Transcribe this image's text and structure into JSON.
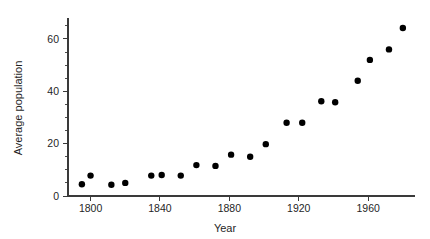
{
  "chart_data": {
    "type": "scatter",
    "title": "",
    "subtitle": "",
    "xlabel": "Year",
    "ylabel": "Average population",
    "xlim": [
      1787,
      1987
    ],
    "ylim": [
      0,
      68
    ],
    "xticks": [
      1800,
      1840,
      1880,
      1920,
      1960
    ],
    "xtick_labels": [
      "1800",
      "1840",
      "1880",
      "1920",
      "1960"
    ],
    "yticks": [
      0,
      20,
      40,
      60
    ],
    "ytick_labels": [
      "0",
      "20",
      "40",
      "60"
    ],
    "y_minor_ticks": [
      5,
      10,
      15,
      25,
      30,
      35,
      45,
      50,
      55,
      65
    ],
    "grid": false,
    "legend": null,
    "marker": "filled-circle",
    "marker_color": "#000000",
    "marker_size_px": 3.2,
    "points": [
      {
        "x": 1795,
        "y": 4.5
      },
      {
        "x": 1800,
        "y": 7.8
      },
      {
        "x": 1812,
        "y": 4.3
      },
      {
        "x": 1820,
        "y": 5.0
      },
      {
        "x": 1835,
        "y": 7.8
      },
      {
        "x": 1841,
        "y": 8.0
      },
      {
        "x": 1852,
        "y": 7.8
      },
      {
        "x": 1861,
        "y": 11.8
      },
      {
        "x": 1872,
        "y": 11.5
      },
      {
        "x": 1881,
        "y": 15.8
      },
      {
        "x": 1892,
        "y": 15.0
      },
      {
        "x": 1901,
        "y": 19.8
      },
      {
        "x": 1913,
        "y": 28.0
      },
      {
        "x": 1922,
        "y": 28.0
      },
      {
        "x": 1933,
        "y": 36.2
      },
      {
        "x": 1941,
        "y": 35.8
      },
      {
        "x": 1954,
        "y": 44.0
      },
      {
        "x": 1961,
        "y": 52.0
      },
      {
        "x": 1972,
        "y": 56.0
      },
      {
        "x": 1980,
        "y": 64.2
      }
    ]
  },
  "axes": {
    "y_axis_label": "Average population",
    "x_axis_label": "Year"
  }
}
